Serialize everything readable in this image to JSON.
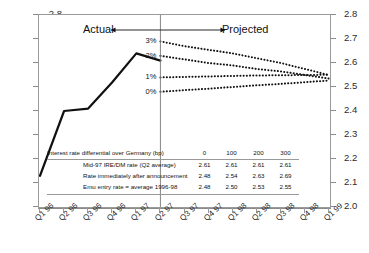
{
  "chart_data": {
    "type": "line",
    "title": "",
    "xlabel": "",
    "ylabel": "",
    "ylim": [
      2.0,
      2.8
    ],
    "yticks": [
      "2.8",
      "2.7",
      "2.6",
      "2.5",
      "2.4",
      "2.3",
      "2.2",
      "2.1",
      "2.0"
    ],
    "grid": false,
    "legend": "none",
    "categories": [
      "Q1 96",
      "Q2 96",
      "Q3 96",
      "Q4 96",
      "Q1 97",
      "Q2 97",
      "Q3 97",
      "Q4 97",
      "Q1 98",
      "Q2 98",
      "Q3 98",
      "Q4 98",
      "Q1 99"
    ],
    "series": [
      {
        "name": "Actual",
        "style": "solid",
        "x": [
          "Q1 96",
          "Q2 96",
          "Q3 96",
          "Q4 96",
          "Q1 97",
          "Q2 97"
        ],
        "values": [
          2.13,
          2.4,
          2.41,
          2.52,
          2.64,
          2.61
        ]
      },
      {
        "name": "3%",
        "style": "dotted",
        "x": [
          "Q2 97",
          "Q3 97",
          "Q4 97",
          "Q1 98",
          "Q2 98",
          "Q3 98",
          "Q4 98",
          "Q1 99"
        ],
        "values": [
          2.69,
          2.67,
          2.655,
          2.64,
          2.62,
          2.6,
          2.575,
          2.55
        ]
      },
      {
        "name": "2%",
        "style": "dotted",
        "x": [
          "Q2 97",
          "Q3 97",
          "Q4 97",
          "Q1 98",
          "Q2 98",
          "Q3 98",
          "Q4 98",
          "Q1 99"
        ],
        "values": [
          2.63,
          2.615,
          2.6,
          2.59,
          2.575,
          2.565,
          2.55,
          2.535
        ]
      },
      {
        "name": "1%",
        "style": "dotted",
        "x": [
          "Q2 97",
          "Q3 97",
          "Q4 97",
          "Q1 98",
          "Q2 98",
          "Q3 98",
          "Q4 98",
          "Q1 99"
        ],
        "values": [
          2.54,
          2.542,
          2.544,
          2.546,
          2.548,
          2.549,
          2.55,
          2.551
        ]
      },
      {
        "name": "0%",
        "style": "dotted",
        "x": [
          "Q2 97",
          "Q3 97",
          "Q4 97",
          "Q1 98",
          "Q2 98",
          "Q3 98",
          "Q4 98",
          "Q1 99"
        ],
        "values": [
          2.48,
          2.487,
          2.493,
          2.5,
          2.507,
          2.513,
          2.52,
          2.527
        ]
      }
    ],
    "annotations": {
      "actual_label": "Actual",
      "projected_label": "Projected",
      "divider_at": "Q2 97",
      "scenario_labels": [
        "3%",
        "2%",
        "1%",
        "0%"
      ]
    }
  },
  "axes": {
    "left_ticks": [
      "2.8",
      "2.7",
      "2.6",
      "2.5",
      "2.4",
      "2.3",
      "2.2",
      "2.1",
      "2.0"
    ],
    "right_ticks": [
      "2.8",
      "2.7",
      "2.6",
      "2.5",
      "2.4",
      "2.3",
      "2.2",
      "2.1",
      "2.0"
    ],
    "x_labels": [
      "Q1 96",
      "Q2 96",
      "Q3 96",
      "Q4 96",
      "Q1 97",
      "Q2 97",
      "Q3 97",
      "Q4 97",
      "Q1 98",
      "Q2 98",
      "Q3 98",
      "Q4 98",
      "Q1 99"
    ]
  },
  "table": {
    "header_label": "Interest rate differential over Germany (bp)",
    "header_values": [
      "0",
      "100",
      "200",
      "300"
    ],
    "rows": [
      {
        "label": "Mid-97 IRE/DM rate (Q2 average)",
        "values": [
          "2.61",
          "2.61",
          "2.61",
          "2.61"
        ]
      },
      {
        "label": "Rate immediately after announcement",
        "values": [
          "2.48",
          "2.54",
          "2.63",
          "2.69"
        ]
      },
      {
        "label": "Emu entry rate = average 1996-98",
        "values": [
          "2.48",
          "2.50",
          "2.53",
          "2.55"
        ]
      }
    ]
  },
  "colors": {
    "line": "#111111",
    "frame": "#9a9a9a",
    "text": "#1a1a1a",
    "background": "#ffffff"
  }
}
